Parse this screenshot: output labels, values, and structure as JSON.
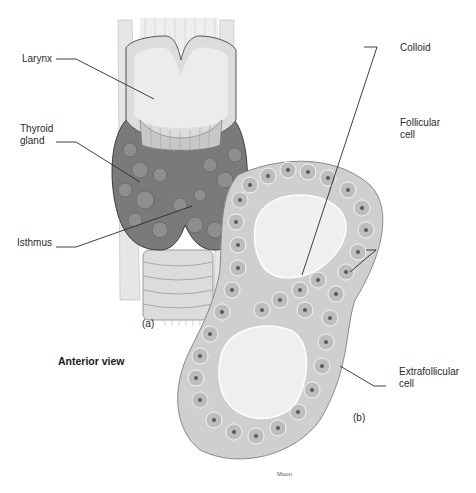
{
  "diagram": {
    "view_caption": "Anterior view",
    "panels": [
      {
        "id": "a",
        "label": "(a)",
        "description": "Anterior view of larynx and thyroid gland"
      },
      {
        "id": "b",
        "label": "(b)",
        "description": "Thyroid follicles histology"
      }
    ],
    "labels": {
      "larynx": "Larynx",
      "thyroid_gland": "Thyroid\ngland",
      "isthmus": "Isthmus",
      "colloid": "Colloid",
      "follicular_cell": "Follicular\ncell",
      "extrafollicular_cell": "Extrafollicular\ncell"
    },
    "artist_signature": "Moon",
    "colors": {
      "leader_line": "#2a2a2a",
      "gland_dark": "#6e6e6e",
      "cartilage": "#d9d9d9",
      "cell_fill": "#bdbdbd",
      "colloid_fill": "#efefef",
      "nucleus": "#5a5a5a"
    }
  }
}
